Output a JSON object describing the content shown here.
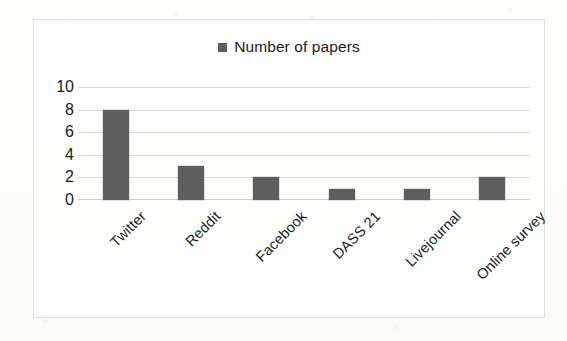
{
  "chart_data": {
    "type": "bar",
    "title": "",
    "subtitle": "",
    "xlabel": "",
    "ylabel": "",
    "categories": [
      "Twitter",
      "Reddit",
      "Facebook",
      "DASS 21",
      "Livejournal",
      "Online survey"
    ],
    "values": [
      8,
      3,
      2,
      1,
      1,
      2
    ],
    "series": [
      {
        "name": "Number of papers",
        "values": [
          8,
          3,
          2,
          1,
          1,
          2
        ],
        "color": "#5e5e5e"
      }
    ],
    "ylim": [
      0,
      10
    ],
    "yticks": [
      0,
      2,
      4,
      6,
      8,
      10
    ],
    "ytick_labels": [
      "0",
      "2",
      "4",
      "6",
      "8",
      "10"
    ],
    "grid": true,
    "grid_axis": "y",
    "legend": {
      "show": true,
      "position": "top-center",
      "entries": [
        {
          "label": "Number of papers",
          "color": "#5e5e5e",
          "marker": "square"
        }
      ]
    },
    "xtick_rotation": -45,
    "bar_color": "#5e5e5e",
    "gridline_color": "#d9d9d7",
    "frame_color": "#e2e2e0",
    "background_color": "#fdfdfc"
  },
  "legend": {
    "label": "Number of papers"
  },
  "axis": {
    "y_ticks": [
      "10",
      "8",
      "6",
      "4",
      "2",
      "0"
    ],
    "x_ticks": [
      "Twitter",
      "Reddit",
      "Facebook",
      "DASS 21",
      "Livejournal",
      "Online survey"
    ]
  }
}
